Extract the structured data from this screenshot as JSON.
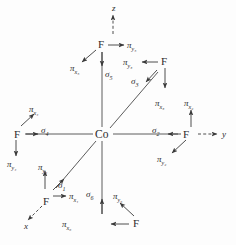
{
  "figure": {
    "kind": "octahedral-coordination-vector-diagram",
    "background_color": "#fdfdfd",
    "stroke_color": "#3a3a3a",
    "text_color": "#2b2b2b",
    "center_atom": "Co",
    "ligand_atom": "F",
    "ligand_count": 6
  },
  "axes": [
    {
      "id": "z",
      "label": "z",
      "dashed": true,
      "x": 112,
      "y": 4,
      "direction": "up"
    },
    {
      "id": "y",
      "label": "y",
      "dashed": true,
      "x": 222,
      "y": 134,
      "direction": "right"
    },
    {
      "id": "x",
      "label": "x",
      "dashed": true,
      "x": 24,
      "y": 224,
      "direction": "down-left"
    }
  ],
  "center": {
    "label": "Co",
    "x": 95,
    "y": 129
  },
  "ligands": [
    {
      "id": "F1",
      "label": "F",
      "x": 43,
      "y": 196,
      "position": "lower-left-diagonal"
    },
    {
      "id": "F2",
      "label": "F",
      "x": 188,
      "y": 130,
      "position": "right"
    },
    {
      "id": "F3",
      "label": "F",
      "x": 163,
      "y": 59,
      "position": "upper-right-diagonal"
    },
    {
      "id": "F4",
      "label": "F",
      "x": 12,
      "y": 130,
      "position": "left"
    },
    {
      "id": "F5",
      "label": "F",
      "x": 96,
      "y": 42,
      "position": "up"
    },
    {
      "id": "F6",
      "label": "F",
      "x": 136,
      "y": 221,
      "position": "down"
    }
  ],
  "sigma_labels": [
    {
      "id": "sigma1",
      "glyph": "σ",
      "sub": "1",
      "x": 58,
      "y": 181
    },
    {
      "id": "sigma2",
      "glyph": "σ",
      "sub": "2",
      "x": 154,
      "y": 127
    },
    {
      "id": "sigma3",
      "glyph": "σ",
      "sub": "3",
      "x": 133,
      "y": 78
    },
    {
      "id": "sigma4",
      "glyph": "σ",
      "sub": "4",
      "x": 41,
      "y": 127
    },
    {
      "id": "sigma5",
      "glyph": "σ",
      "sub": "5",
      "x": 104,
      "y": 71
    },
    {
      "id": "sigma6",
      "glyph": "σ",
      "sub": "6",
      "x": 86,
      "y": 190
    }
  ],
  "pi_labels": [
    {
      "id": "pi_x1",
      "glyph": "π",
      "sub": "x₁",
      "x": 69,
      "y": 196
    },
    {
      "id": "pi_y1",
      "glyph": "π",
      "sub": "y₁",
      "x": 38,
      "y": 163
    },
    {
      "id": "pi_x2",
      "glyph": "π",
      "sub": "x₂",
      "x": 186,
      "y": 100
    },
    {
      "id": "pi_y2",
      "glyph": "π",
      "sub": "y₂",
      "x": 158,
      "y": 156
    },
    {
      "id": "pi_x3",
      "glyph": "π",
      "sub": "x₃",
      "x": 157,
      "y": 100
    },
    {
      "id": "pi_y3",
      "glyph": "π",
      "sub": "y₃",
      "x": 126,
      "y": 69
    },
    {
      "id": "pi_x4",
      "glyph": "π",
      "sub": "x₄",
      "x": 29,
      "y": 109
    },
    {
      "id": "pi_y4",
      "glyph": "π",
      "sub": "y₄",
      "x": 9,
      "y": 164
    },
    {
      "id": "pi_x5",
      "glyph": "π",
      "sub": "x₅",
      "x": 72,
      "y": 65
    },
    {
      "id": "pi_y5",
      "glyph": "π",
      "sub": "y₅",
      "x": 128,
      "y": 42
    },
    {
      "id": "pi_x6",
      "glyph": "π",
      "sub": "x₆",
      "x": 62,
      "y": 203
    },
    {
      "id": "pi_y6",
      "glyph": "π",
      "sub": "y₆",
      "x": 113,
      "y": 196
    }
  ]
}
